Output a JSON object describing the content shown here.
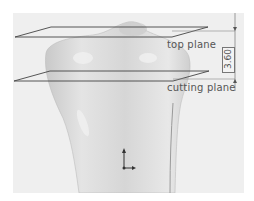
{
  "figure": {
    "type": "cad-3d-view",
    "background_color": "#efefef",
    "model_color": "#d9d9d9",
    "plane_line_color": "#444444"
  },
  "planes": [
    {
      "name": "top plane",
      "label": "top plane"
    },
    {
      "name": "cutting plane",
      "label": "cutting plane"
    }
  ],
  "dimension": {
    "value": "3.60",
    "orientation": "vertical",
    "between": [
      "top plane",
      "cutting plane"
    ]
  },
  "triad": {
    "icon": "coordinate-axes-icon"
  }
}
